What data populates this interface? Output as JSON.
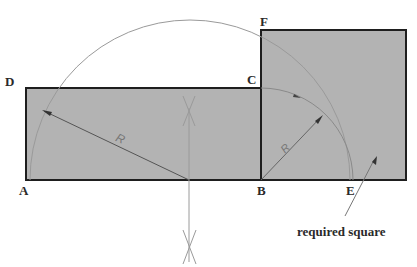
{
  "diagram": {
    "points": {
      "A": {
        "label": "A",
        "x": 26,
        "y": 180
      },
      "B": {
        "label": "B",
        "x": 261,
        "y": 180
      },
      "C": {
        "label": "C",
        "x": 261,
        "y": 88
      },
      "D": {
        "label": "D",
        "x": 26,
        "y": 88
      },
      "E": {
        "label": "E",
        "x": 353,
        "y": 180
      },
      "F": {
        "label": "F",
        "x": 261,
        "y": 30
      }
    },
    "radius_label_large": "R",
    "radius_label_small": "R",
    "annotation": "required square",
    "colors": {
      "fill": "#b3b3b3",
      "outline": "#1e1e1e",
      "construction": "#9a9a9a",
      "text": "#2a2a2a"
    }
  }
}
